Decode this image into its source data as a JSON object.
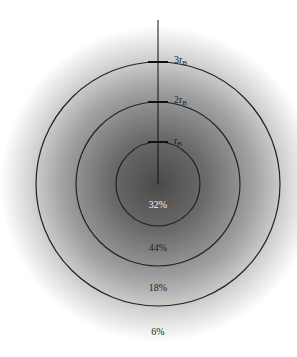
{
  "diagram": {
    "center": {
      "x": 158,
      "y": 184
    },
    "glow": {
      "inner_color": "#4a4a4a",
      "outer_color": "#ffffff",
      "radius": 158
    },
    "axis_line": {
      "x": 158,
      "y_top": 20,
      "y_bottom": 184,
      "color": "#111111"
    },
    "rings": [
      {
        "name": "inner",
        "radius": 42,
        "label": "r",
        "subscript": "B",
        "label_value": "rB"
      },
      {
        "name": "middle",
        "radius": 82,
        "label": "2r",
        "subscript": "B",
        "label_value": "2rB"
      },
      {
        "name": "outer",
        "radius": 122,
        "label": "3r",
        "subscript": "B",
        "label_value": "3rB"
      }
    ],
    "percentages": [
      {
        "region": "inside rB",
        "text": "32%",
        "y": 208,
        "color": "#f2f2f2"
      },
      {
        "region": "rB to 2rB",
        "text": "44%",
        "y": 251,
        "color": "#222222"
      },
      {
        "region": "2rB to 3rB",
        "text": "18%",
        "y": 291,
        "color": "#222222"
      },
      {
        "region": "beyond 3rB",
        "text": "6%",
        "y": 335,
        "color": "#222222"
      }
    ]
  }
}
